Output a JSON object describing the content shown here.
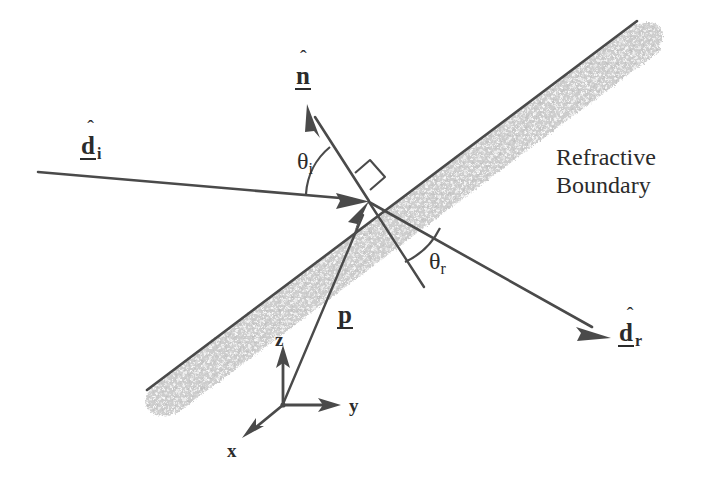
{
  "figure": {
    "background_color": "#ffffff",
    "line_color": "#4a4a4a",
    "text_color": "#2b2b2b",
    "band_color": "#c9c9c9",
    "band_edge_color": "#4a4a4a"
  },
  "caption": {
    "line1": "Refractive",
    "line2": "Boundary"
  },
  "vectors": {
    "incident": {
      "base": "d",
      "hat": "ˆ",
      "subscript": "i",
      "name": "incident direction unit vector"
    },
    "normal": {
      "base": "n",
      "hat": "ˆ",
      "subscript": "",
      "name": "surface normal unit vector"
    },
    "refracted": {
      "base": "d",
      "hat": "ˆ",
      "subscript": "r",
      "name": "refracted direction unit vector"
    },
    "position": {
      "base": "p",
      "hat": "",
      "subscript": "",
      "name": "position vector of intersection point"
    }
  },
  "angles": {
    "incidence": {
      "symbol": "θ",
      "subscript": "i",
      "name": "angle of incidence"
    },
    "refraction": {
      "symbol": "θ",
      "subscript": "r",
      "name": "angle of refraction"
    }
  },
  "axes": {
    "x": "x",
    "y": "y",
    "z": "z"
  },
  "markers": {
    "right_angle": "right-angle-marker"
  }
}
